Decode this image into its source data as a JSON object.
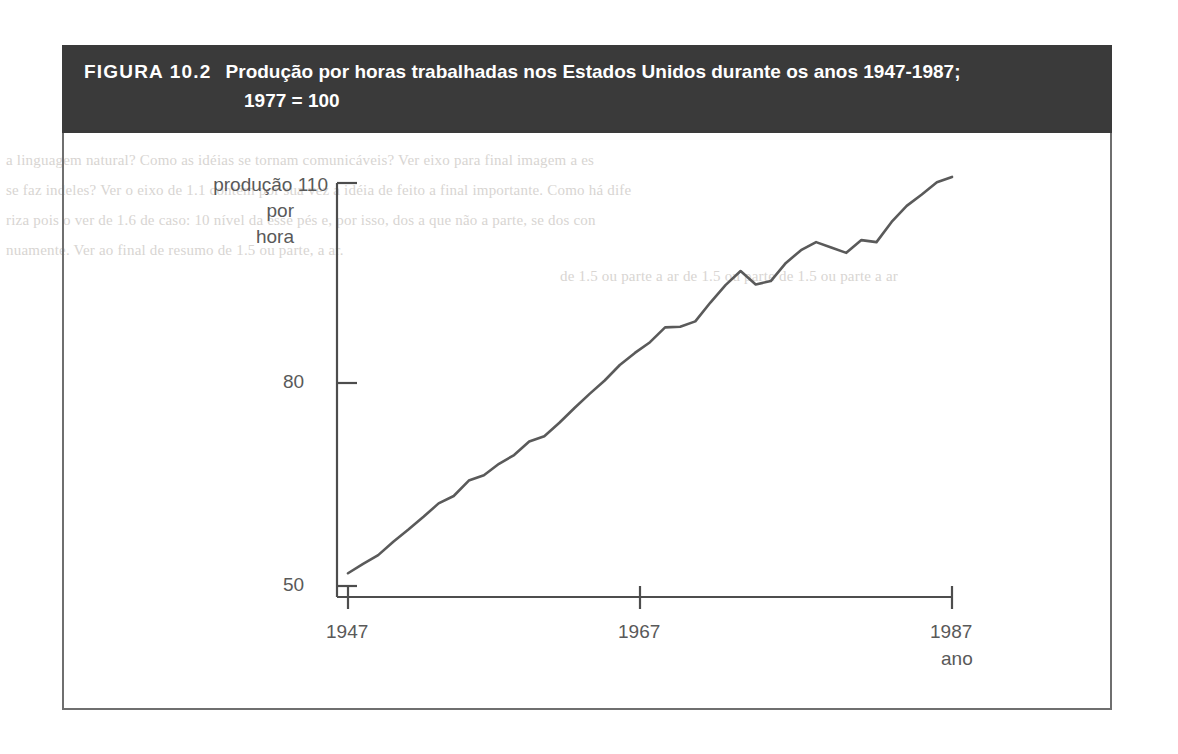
{
  "figure": {
    "number_label": "FIGURA 10.2",
    "title_line1": "Produção por horas trabalhadas nos Estados Unidos durante os anos 1947-1987;",
    "title_line2": "1977 = 100",
    "header_bg": "#3a3a3a",
    "header_fg": "#ffffff",
    "frame_color": "#6f6f6f",
    "line_color": "#5a5a5a"
  },
  "axes": {
    "ylabel_line1": "produção",
    "ylabel_line2": "por",
    "ylabel_line3": "hora",
    "ytick_110": "110",
    "ytick_80": "80",
    "ytick_50": "50",
    "xtick_1947": "1947",
    "xtick_1967": "1967",
    "xtick_1987": "1987",
    "xlabel": "ano"
  },
  "bleed_text": {
    "l1": "a linguagem natural? Como as idéias se tornam comunicáveis? Ver eixo para final imagem a es",
    "l2": "se faz indeles? Ver o eixo de 1.1 contém por sua vez a idéia de feito a final importante. Como há dife",
    "l3": "riza pois o ver de 1.6 de caso: 10 nível da esse pés e, por isso, dos a que não a parte, se dos con",
    "l4": "nuamente. Ver ao final de resumo de 1.5 ou parte, a ar.",
    "l5": "de 1.5 ou parte a ar de 1.5 ou parte de 1.5 ou parte a ar"
  },
  "chart_data": {
    "type": "line",
    "title": "Produção por horas trabalhadas nos Estados Unidos durante os anos 1947-1987; 1977 = 100",
    "xlabel": "ano",
    "ylabel": "produção por hora",
    "xlim": [
      1947,
      1987
    ],
    "ylim": [
      50,
      112
    ],
    "xticks": [
      1947,
      1967,
      1987
    ],
    "yticks": [
      50,
      80,
      110
    ],
    "grid": false,
    "legend": false,
    "series": [
      {
        "name": "produção por hora (1977 = 100)",
        "x": [
          1947,
          1948,
          1949,
          1950,
          1951,
          1952,
          1953,
          1954,
          1955,
          1956,
          1957,
          1958,
          1959,
          1960,
          1961,
          1962,
          1963,
          1964,
          1965,
          1966,
          1967,
          1968,
          1969,
          1970,
          1971,
          1972,
          1973,
          1974,
          1975,
          1976,
          1977,
          1978,
          1979,
          1980,
          1981,
          1982,
          1983,
          1984,
          1985,
          1986,
          1987
        ],
        "y": [
          51.9,
          53.3,
          54.6,
          56.6,
          58.4,
          60.3,
          62.3,
          63.4,
          65.7,
          66.5,
          68.2,
          69.5,
          71.5,
          72.3,
          74.3,
          76.5,
          78.6,
          80.6,
          82.9,
          84.7,
          86.3,
          88.5,
          88.6,
          89.4,
          92.2,
          94.8,
          96.9,
          94.9,
          95.4,
          98.1,
          100.0,
          101.2,
          100.4,
          99.6,
          101.5,
          101.2,
          104.2,
          106.6,
          108.3,
          110.1,
          110.9
        ]
      }
    ]
  }
}
